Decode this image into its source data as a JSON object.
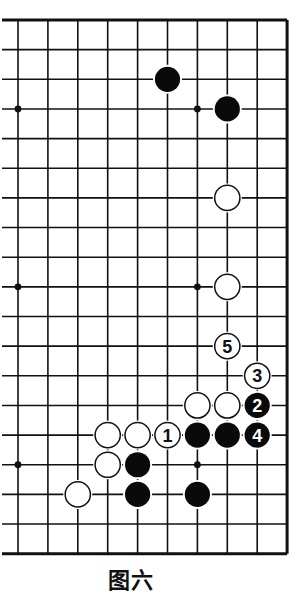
{
  "diagram": {
    "type": "go-board-partial",
    "caption": "图六",
    "grid": {
      "columns": 10,
      "rows": 19,
      "right_edge": true,
      "top_edge": true,
      "bottom_edge": true,
      "left_edge": false
    },
    "star_points": [
      {
        "col": 0,
        "row": 3
      },
      {
        "col": 6,
        "row": 3
      },
      {
        "col": 0,
        "row": 9
      },
      {
        "col": 6,
        "row": 9
      },
      {
        "col": 0,
        "row": 15
      },
      {
        "col": 6,
        "row": 15
      }
    ],
    "stones": [
      {
        "color": "black",
        "col": 5,
        "row": 2,
        "label": ""
      },
      {
        "color": "black",
        "col": 7,
        "row": 3,
        "label": ""
      },
      {
        "color": "white",
        "col": 7,
        "row": 6,
        "label": ""
      },
      {
        "color": "white",
        "col": 7,
        "row": 9,
        "label": ""
      },
      {
        "color": "white",
        "col": 7,
        "row": 11,
        "label": "5"
      },
      {
        "color": "white",
        "col": 8,
        "row": 12,
        "label": "3"
      },
      {
        "color": "white",
        "col": 6,
        "row": 13,
        "label": ""
      },
      {
        "color": "white",
        "col": 7,
        "row": 13,
        "label": ""
      },
      {
        "color": "black",
        "col": 8,
        "row": 13,
        "label": "2"
      },
      {
        "color": "white",
        "col": 3,
        "row": 14,
        "label": ""
      },
      {
        "color": "white",
        "col": 4,
        "row": 14,
        "label": ""
      },
      {
        "color": "white",
        "col": 5,
        "row": 14,
        "label": "1"
      },
      {
        "color": "black",
        "col": 6,
        "row": 14,
        "label": ""
      },
      {
        "color": "black",
        "col": 7,
        "row": 14,
        "label": ""
      },
      {
        "color": "black",
        "col": 8,
        "row": 14,
        "label": "4"
      },
      {
        "color": "white",
        "col": 3,
        "row": 15,
        "label": ""
      },
      {
        "color": "black",
        "col": 4,
        "row": 15,
        "label": ""
      },
      {
        "color": "white",
        "col": 2,
        "row": 16,
        "label": ""
      },
      {
        "color": "black",
        "col": 4,
        "row": 16,
        "label": ""
      },
      {
        "color": "black",
        "col": 6,
        "row": 16,
        "label": ""
      }
    ],
    "colors": {
      "line": "#111111",
      "black_stone": "#0a0a0a",
      "white_stone": "#ffffff",
      "background": "#ffffff"
    }
  }
}
